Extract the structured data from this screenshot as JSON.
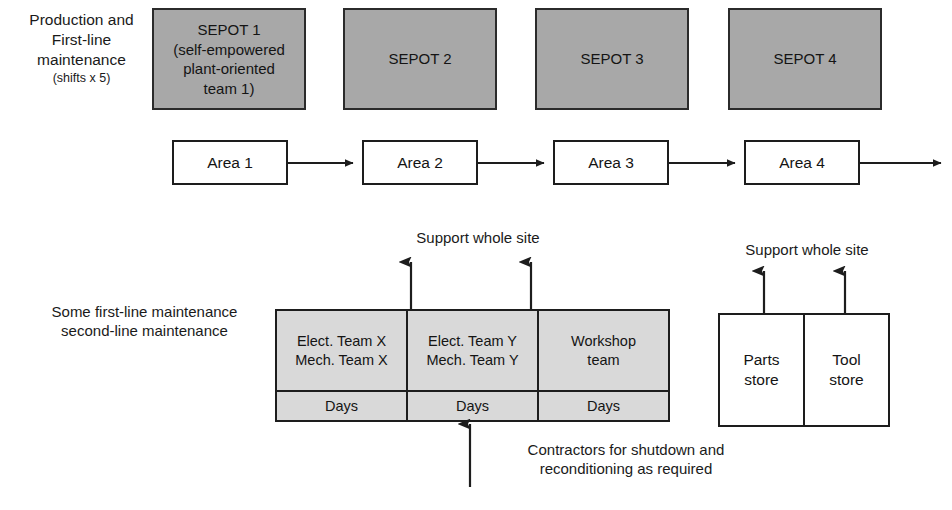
{
  "diagram": {
    "rows": {
      "production": {
        "label": "Production and\nFirst-line\nmaintenance",
        "sublabel": "(shifts x 5)",
        "boxes": [
          {
            "name": "sepot-1",
            "text": "SEPOT 1\n(self-empowered\nplant-oriented\nteam 1)"
          },
          {
            "name": "sepot-2",
            "text": "SEPOT 2"
          },
          {
            "name": "sepot-3",
            "text": "SEPOT 3"
          },
          {
            "name": "sepot-4",
            "text": "SEPOT 4"
          }
        ]
      },
      "areas": {
        "boxes": [
          {
            "name": "area-1",
            "text": "Area 1"
          },
          {
            "name": "area-2",
            "text": "Area 2"
          },
          {
            "name": "area-3",
            "text": "Area 3"
          },
          {
            "name": "area-4",
            "text": "Area 4"
          }
        ]
      },
      "maintenance": {
        "label": "Some first-line maintenance\nsecond-line maintenance",
        "support_label_left": "Support whole site",
        "support_label_right": "Support whole site",
        "teams": [
          {
            "name": "team-x",
            "text": "Elect. Team X\nMech. Team X",
            "shift": "Days"
          },
          {
            "name": "team-y",
            "text": "Elect. Team Y\nMech. Team Y",
            "shift": "Days"
          },
          {
            "name": "workshop-team",
            "text": "Workshop\nteam",
            "shift": "Days"
          }
        ],
        "stores": [
          {
            "name": "parts-store",
            "text": "Parts\nstore"
          },
          {
            "name": "tool-store",
            "text": "Tool\nstore"
          }
        ],
        "contractors_note": "Contractors for shutdown and\nreconditioning as required"
      }
    },
    "colors": {
      "sepot_fill": "#a8a8a8",
      "table_fill": "#d9d9d9",
      "line": "#1d1d1d",
      "text": "#141414",
      "background": "#ffffff"
    }
  }
}
